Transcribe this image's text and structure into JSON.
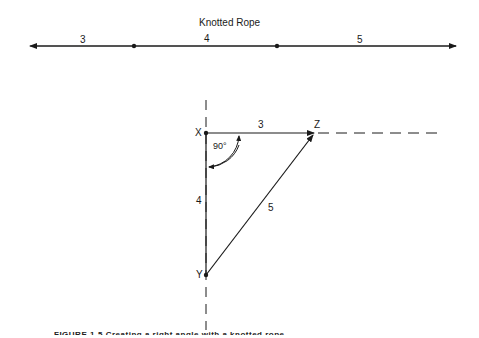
{
  "figure": {
    "rope": {
      "title": "Knotted Rope",
      "segments": [
        "3",
        "4",
        "5"
      ]
    },
    "triangle": {
      "vertices": {
        "x": "X",
        "y": "Y",
        "z": "Z"
      },
      "sides": {
        "xz": "3",
        "xy": "4",
        "yz": "5"
      },
      "angle_label": "90°"
    },
    "caption": "FIGURE 1-5  Creating a right angle with a knotted rope"
  }
}
